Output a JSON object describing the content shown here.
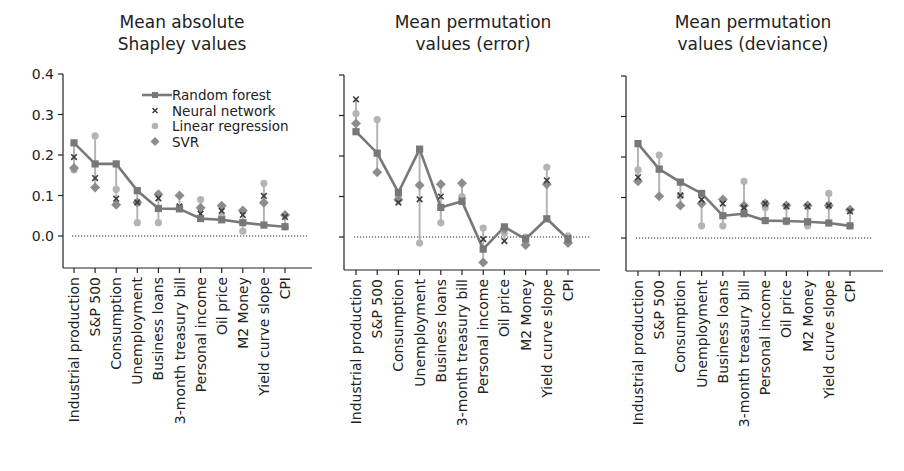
{
  "figure": {
    "background": "#ffffff"
  },
  "legend": {
    "entries": [
      {
        "label": "Random forest",
        "marker": "square-line"
      },
      {
        "label": "Neural network",
        "marker": "x"
      },
      {
        "label": "Linear regression",
        "marker": "circle"
      },
      {
        "label": "SVR",
        "marker": "diamond"
      }
    ]
  },
  "colors": {
    "random_forest": "#787878",
    "neural_network": "#3c3c3c",
    "linear_regression": "#b4b4b4",
    "svr": "#8c8c8c",
    "axis": "#222222",
    "zero_line": "#222222"
  },
  "chart_data": [
    {
      "type": "line",
      "title": "Mean absolute\nShapley values",
      "title_lines": [
        "Mean absolute",
        "Shapley values"
      ],
      "xlabel": "",
      "ylabel": "",
      "ylim": [
        -0.025,
        0.4
      ],
      "yticks": [
        0.0,
        0.1,
        0.2,
        0.3,
        0.4
      ],
      "ytick_labels": [
        "0.0",
        "0.1",
        "0.2",
        "0.3",
        "0.4"
      ],
      "show_yticklabels": true,
      "zero_line": "dotted",
      "legend_position": "upper right",
      "categories": [
        "Industrial production",
        "S&P 500",
        "Consumption",
        "Unemployment",
        "Business loans",
        "3-month treasury bill",
        "Personal income",
        "Oil price",
        "M2 Money",
        "Yield curve slope",
        "CPI"
      ],
      "series": [
        {
          "name": "Random forest",
          "values": [
            0.23,
            0.178,
            0.178,
            0.112,
            0.068,
            0.067,
            0.043,
            0.04,
            0.033,
            0.027,
            0.023
          ]
        },
        {
          "name": "Neural network",
          "values": [
            0.195,
            0.143,
            0.092,
            0.083,
            0.093,
            0.073,
            0.055,
            0.062,
            0.052,
            0.099,
            0.047
          ]
        },
        {
          "name": "Linear regression",
          "values": [
            0.163,
            0.247,
            0.115,
            0.033,
            0.033,
            0.07,
            0.09,
            0.048,
            0.012,
            0.13,
            0.022
          ]
        },
        {
          "name": "SVR",
          "values": [
            0.168,
            0.12,
            0.077,
            0.083,
            0.103,
            0.1,
            0.07,
            0.075,
            0.063,
            0.082,
            0.052
          ]
        }
      ]
    },
    {
      "type": "line",
      "title": "Mean permutation\nvalues (error)",
      "title_lines": [
        "Mean permutation",
        "values (error)"
      ],
      "xlabel": "",
      "ylabel": "",
      "ylim": [
        -0.08,
        0.4
      ],
      "yticks": [
        0.0,
        0.1,
        0.2,
        0.3,
        0.4
      ],
      "ytick_labels": [
        "0.0",
        "0.1",
        "0.2",
        "0.3",
        "0.4"
      ],
      "show_yticklabels": false,
      "zero_line": "dotted",
      "categories": [
        "Industrial production",
        "S&P 500",
        "Consumption",
        "Unemployment",
        "Business loans",
        "3-month treasury bill",
        "Personal income",
        "Oil price",
        "M2 Money",
        "Yield curve slope",
        "CPI"
      ],
      "series": [
        {
          "name": "Random forest",
          "values": [
            0.26,
            0.207,
            0.11,
            0.217,
            0.073,
            0.088,
            -0.03,
            0.025,
            -0.005,
            0.045,
            -0.005
          ]
        },
        {
          "name": "Neural network",
          "values": [
            0.34,
            0.207,
            0.085,
            0.093,
            0.1,
            0.09,
            -0.005,
            -0.01,
            -0.003,
            0.14,
            -0.003
          ]
        },
        {
          "name": "Linear regression",
          "values": [
            0.305,
            0.29,
            0.1,
            -0.015,
            0.035,
            0.1,
            0.022,
            0.01,
            0.0,
            0.172,
            0.003
          ]
        },
        {
          "name": "SVR",
          "values": [
            0.28,
            0.16,
            0.092,
            0.128,
            0.13,
            0.133,
            -0.063,
            0.02,
            -0.02,
            0.13,
            -0.015
          ]
        }
      ]
    },
    {
      "type": "line",
      "title": "Mean permutation\nvalues (deviance)",
      "title_lines": [
        "Mean permutation",
        "values (deviance)"
      ],
      "xlabel": "",
      "ylabel": "",
      "ylim": [
        -0.03,
        0.4
      ],
      "yticks": [
        0.0,
        0.1,
        0.2,
        0.3,
        0.4
      ],
      "ytick_labels": [
        "0.0",
        "0.1",
        "0.2",
        "0.3",
        "0.4"
      ],
      "show_yticklabels": false,
      "zero_line": "dotted",
      "categories": [
        "Industrial production",
        "S&P 500",
        "Consumption",
        "Unemployment",
        "Business loans",
        "3-month treasury bill",
        "Personal income",
        "Oil price",
        "M2 Money",
        "Yield curve slope",
        "CPI"
      ],
      "series": [
        {
          "name": "Random forest",
          "values": [
            0.233,
            0.17,
            0.138,
            0.11,
            0.055,
            0.06,
            0.043,
            0.042,
            0.04,
            0.037,
            0.03
          ]
        },
        {
          "name": "Neural network",
          "values": [
            0.15,
            0.17,
            0.105,
            0.095,
            0.085,
            0.075,
            0.085,
            0.078,
            0.078,
            0.08,
            0.066
          ]
        },
        {
          "name": "Linear regression",
          "values": [
            0.168,
            0.205,
            0.105,
            0.03,
            0.03,
            0.14,
            0.075,
            0.04,
            0.03,
            0.11,
            0.03
          ]
        },
        {
          "name": "SVR",
          "values": [
            0.14,
            0.103,
            0.08,
            0.085,
            0.095,
            0.08,
            0.085,
            0.08,
            0.08,
            0.08,
            0.07
          ]
        }
      ]
    }
  ]
}
